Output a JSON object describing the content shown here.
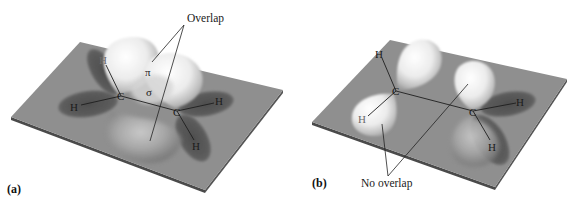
{
  "figure": {
    "panels": [
      {
        "label": "(a)",
        "description": "Planar ethylene: p orbitals parallel, pi overlap",
        "callout": "Overlap",
        "pi_label": "π",
        "sigma_label": "σ",
        "atoms": {
          "c1": "C",
          "c2": "C",
          "h_upper_left": "H",
          "h_left": "H",
          "h_right": "H",
          "h_lower_right": "H"
        }
      },
      {
        "label": "(b)",
        "description": "Twisted ethylene: p orbitals perpendicular, no overlap",
        "callout": "No overlap",
        "atoms": {
          "c1": "C",
          "c2": "C",
          "h_top": "H",
          "h_lower_left": "H",
          "h_right": "H",
          "h_lower_right": "H"
        }
      }
    ],
    "colors": {
      "plane": "#8e8e8e",
      "plane_edge": "#4a4a4a",
      "lobe_light": "#f4f4f4",
      "lobe_shadow": "#5e5e5e",
      "background": "#ffffff"
    }
  }
}
